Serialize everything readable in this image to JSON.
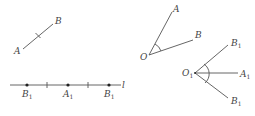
{
  "figures": {
    "segment": {
      "A": "A",
      "B": "B"
    },
    "line": {
      "name": "l",
      "points": [
        {
          "label": "B",
          "sub": "1"
        },
        {
          "label": "A",
          "sub": "1"
        },
        {
          "label": "B",
          "sub": "1"
        }
      ]
    },
    "angle": {
      "vertex": "O",
      "A": "A",
      "B": "B"
    },
    "angle2": {
      "vertex": "O",
      "vertex_sub": "1",
      "top": "B",
      "top_sub": "1",
      "mid": "A",
      "mid_sub": "1",
      "bottom": "B",
      "bottom_sub": "1"
    }
  },
  "colors": {
    "stroke": "#555555",
    "label": "#444444"
  }
}
